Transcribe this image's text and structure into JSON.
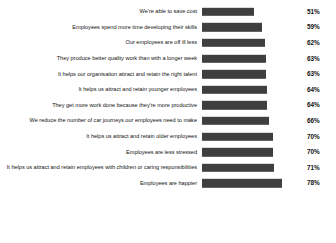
{
  "chart_data": {
    "type": "bar",
    "orientation": "horizontal",
    "title": "",
    "xlabel": "",
    "ylabel": "",
    "xlim": [
      0,
      100
    ],
    "grid": false,
    "legend": false,
    "value_suffix": "%",
    "bar_color": "#3f3f3f",
    "categories": [
      "We're able to save cost",
      "Employees spend more time developing their skills",
      "Our employees are off ill less",
      "They produce better quality work than with a longer week",
      "It helps our organisation attract and retain the right talent",
      "It helps us attract and retain younger employees",
      "They get more work done because they're more productive",
      "We reduce the number of car journeys our employees need to make",
      "It helps us attract and retain older employees",
      "Employees are less stressed",
      "It helps us attract and retain employees with children or caring responsibilities",
      "Employees are happier"
    ],
    "values": [
      51,
      59,
      62,
      63,
      63,
      64,
      64,
      66,
      70,
      70,
      71,
      78
    ],
    "value_labels": [
      "51%",
      "59%",
      "62%",
      "63%",
      "63%",
      "64%",
      "64%",
      "66%",
      "70%",
      "70%",
      "71%",
      "78%"
    ]
  }
}
